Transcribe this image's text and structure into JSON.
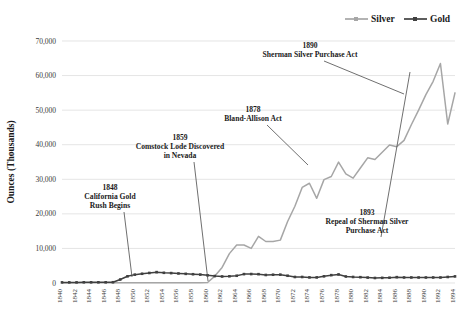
{
  "legend": {
    "position": "top-right",
    "items": [
      {
        "label": "Silver",
        "color": "#a6a6a6",
        "marker": "line-marker"
      },
      {
        "label": "Gold",
        "color": "#404040",
        "marker": "line-marker"
      }
    ]
  },
  "axes": {
    "ylabel": "Ounces (Thousands)",
    "yticks": [
      "0",
      "10,000",
      "20,000",
      "30,000",
      "40,000",
      "50,000",
      "60,000",
      "70,000"
    ],
    "xticks": [
      "1840",
      "1842",
      "1844",
      "1846",
      "1848",
      "1850",
      "1852",
      "1854",
      "1856",
      "1858",
      "1860",
      "1862",
      "1864",
      "1866",
      "1868",
      "1870",
      "1872",
      "1874",
      "1876",
      "1878",
      "1880",
      "1882",
      "1884",
      "1886",
      "1888",
      "1890",
      "1892",
      "1894"
    ]
  },
  "annotations": [
    {
      "id": "california-gold-rush",
      "year": "1848",
      "lines": [
        "1848",
        "California Gold",
        "Rush Begins"
      ],
      "text_x": 110,
      "text_y": 190,
      "point_x": 132,
      "point_y": 277
    },
    {
      "id": "comstock-lode",
      "year": "1859",
      "lines": [
        "1859",
        "Comstock Lode Discovered",
        "in Nevada"
      ],
      "text_x": 180,
      "text_y": 140,
      "point_x": 208,
      "point_y": 281
    },
    {
      "id": "bland-allison-act",
      "year": "1878",
      "lines": [
        "1878",
        "Bland-Allison Act"
      ],
      "text_x": 253,
      "text_y": 112,
      "point_x": 308,
      "point_y": 165
    },
    {
      "id": "sherman-silver-purchase-act",
      "year": "1890",
      "lines": [
        "1890",
        "Sherman Silver Purchase Act"
      ],
      "text_x": 310,
      "text_y": 48,
      "point_x": 404,
      "point_y": 94
    },
    {
      "id": "repeal-of-sherman-silver-purchase-act",
      "year": "1893",
      "lines": [
        "1893",
        "Repeal of Sherman Silver",
        "Purchase Act"
      ],
      "text_x": 367,
      "text_y": 215,
      "point_x": 410,
      "point_y": 72
    }
  ],
  "chart_data": {
    "type": "line",
    "title": "",
    "xlabel": "",
    "ylabel": "Ounces (Thousands)",
    "ylim": [
      0,
      70000
    ],
    "ytick_step": 10000,
    "grid": true,
    "legend_position": "top-right",
    "x": [
      1840,
      1841,
      1842,
      1843,
      1844,
      1845,
      1846,
      1847,
      1848,
      1849,
      1850,
      1851,
      1852,
      1853,
      1854,
      1855,
      1856,
      1857,
      1858,
      1859,
      1860,
      1861,
      1862,
      1863,
      1864,
      1865,
      1866,
      1867,
      1868,
      1869,
      1870,
      1871,
      1872,
      1873,
      1874,
      1875,
      1876,
      1877,
      1878,
      1879,
      1880,
      1881,
      1882,
      1883,
      1884,
      1885,
      1886,
      1887,
      1888,
      1889,
      1890,
      1891,
      1892,
      1893,
      1894
    ],
    "series": [
      {
        "name": "Silver",
        "color": "#a6a6a6",
        "values": [
          50,
          50,
          50,
          50,
          50,
          50,
          50,
          50,
          50,
          50,
          50,
          50,
          50,
          50,
          50,
          50,
          50,
          50,
          50,
          100,
          150,
          2000,
          4500,
          8500,
          11000,
          11000,
          10000,
          13500,
          12000,
          12000,
          12400,
          17800,
          22200,
          27650,
          28850,
          24500,
          29900,
          30800,
          34960,
          31550,
          30320,
          33260,
          36200,
          35730,
          37800,
          39900,
          39440,
          41260,
          45780,
          50000,
          54500,
          58330,
          63500,
          46000,
          55000
        ]
      },
      {
        "name": "Gold",
        "color": "#404040",
        "values": [
          180,
          180,
          180,
          200,
          200,
          200,
          200,
          220,
          1000,
          1935,
          2419,
          2672,
          2902,
          3144,
          2953,
          2863,
          2759,
          2649,
          2538,
          2427,
          2225,
          2010,
          1890,
          1940,
          2100,
          2570,
          2590,
          2550,
          2320,
          2395,
          2418,
          2104,
          1742,
          1742,
          1620,
          1620,
          1930,
          2270,
          2480,
          1880,
          1740,
          1680,
          1570,
          1450,
          1490,
          1540,
          1690,
          1600,
          1600,
          1590,
          1590,
          1600,
          1597,
          1740,
          1910
        ]
      }
    ]
  }
}
